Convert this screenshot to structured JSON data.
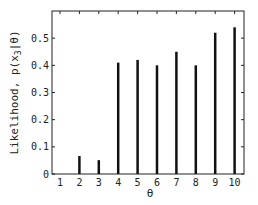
{
  "chart_data": {
    "type": "bar",
    "style": "stem",
    "title": "",
    "xlabel": "θ",
    "ylabel": "Likelihood, p(x3|θ)",
    "ylabel_parts": {
      "prefix": "Likelihood, p(x",
      "subscript": "3",
      "suffix": "|θ)"
    },
    "categories": [
      "1",
      "2",
      "3",
      "4",
      "5",
      "6",
      "7",
      "8",
      "9",
      "10"
    ],
    "values": [
      0.0,
      0.066,
      0.051,
      0.41,
      0.42,
      0.4,
      0.45,
      0.4,
      0.52,
      0.54
    ],
    "ylim": [
      0,
      0.6
    ],
    "yticks": [
      0,
      0.1,
      0.2,
      0.3,
      0.4,
      0.5
    ],
    "ytick_labels": [
      "0",
      "0.1",
      "0.2",
      "0.3",
      "0.4",
      "0.5"
    ],
    "grid": false,
    "legend": null,
    "bar_color": "#111111"
  }
}
